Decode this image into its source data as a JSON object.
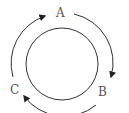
{
  "diagram": {
    "type": "cycle",
    "nodes": [
      {
        "id": "A",
        "label": "A",
        "position": "top"
      },
      {
        "id": "B",
        "label": "B",
        "position": "bottom-right"
      },
      {
        "id": "C",
        "label": "C",
        "position": "bottom-left"
      }
    ],
    "edges": [
      {
        "from": "A",
        "to": "B",
        "direction": "clockwise"
      },
      {
        "from": "B",
        "to": "C",
        "direction": "clockwise"
      },
      {
        "from": "C",
        "to": "A",
        "direction": "clockwise"
      }
    ],
    "colors": {
      "stroke": "#333333",
      "label": "#555555",
      "background": "#ffffff"
    }
  }
}
